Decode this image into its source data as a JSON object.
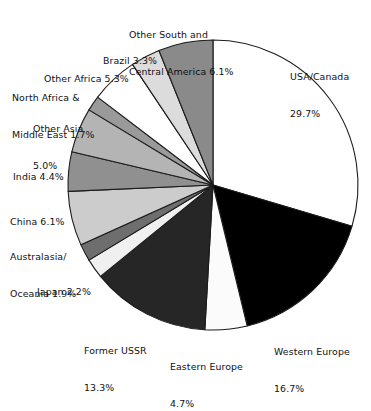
{
  "chart_data": {
    "type": "pie",
    "title": "",
    "subtitle": "",
    "xlabel": "",
    "ylabel": "",
    "legend_position": "none",
    "grid": false,
    "units": "percent",
    "start_angle_deg": 0,
    "direction": "clockwise",
    "categories": [
      "USA/Canada",
      "Western Europe",
      "Eastern Europe",
      "Former USSR",
      "Japan",
      "Australasia/Oceania",
      "China",
      "India",
      "Other Asia",
      "North Africa & Middle East",
      "Other Africa",
      "Brazil",
      "Other South and Central America"
    ],
    "values": [
      29.7,
      16.7,
      4.7,
      13.3,
      2.2,
      1.9,
      6.1,
      4.4,
      5.0,
      1.7,
      5.3,
      3.3,
      6.1
    ],
    "slice_colors": [
      "#ffffff",
      "#000000",
      "#fbfbfb",
      "#262626",
      "#f0f0f0",
      "#6e6e6e",
      "#cccccc",
      "#909090",
      "#b4b4b4",
      "#9a9a9a",
      "#ffffff",
      "#dcdcdc",
      "#8a8a8a"
    ],
    "slice_outline_color": "#1c1c1c",
    "background_color": "#ffffff"
  },
  "labels": [
    {
      "id": "usa-canada",
      "line1": "USA/Canada",
      "line2": "29.7%"
    },
    {
      "id": "western-europe",
      "line1": "Western Europe",
      "line2": "16.7%"
    },
    {
      "id": "eastern-europe",
      "line1": "Eastern Europe",
      "line2": "4.7%"
    },
    {
      "id": "former-ussr",
      "line1": "Former USSR",
      "line2": "13.3%"
    },
    {
      "id": "japan",
      "line1": "Japan 2.2%",
      "line2": ""
    },
    {
      "id": "australasia",
      "line1": "Australasia/",
      "line2": "Oceania 1.9%"
    },
    {
      "id": "china",
      "line1": "China 6.1%",
      "line2": ""
    },
    {
      "id": "india",
      "line1": "India 4.4%",
      "line2": ""
    },
    {
      "id": "other-asia",
      "line1": "Other Asia",
      "line2": "5.0%"
    },
    {
      "id": "north-africa",
      "line1": "North Africa &",
      "line2": "Middle East 1.7%"
    },
    {
      "id": "other-africa",
      "line1": "Other Africa 5.3%",
      "line2": ""
    },
    {
      "id": "brazil",
      "line1": "Brazil 3.3%",
      "line2": ""
    },
    {
      "id": "other-south-central-america",
      "line1": "Other South and",
      "line2": "Central America 6.1%"
    }
  ]
}
